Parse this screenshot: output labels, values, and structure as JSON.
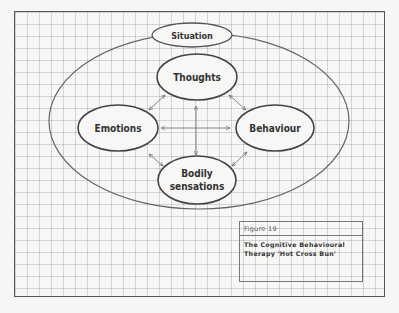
{
  "diagram": {
    "nodes": {
      "situation": "Situation",
      "thoughts": "Thoughts",
      "emotions": "Emotions",
      "behaviour": "Behaviour",
      "bodily_line1": "Bodily",
      "bodily_line2": "sensations"
    },
    "connections": [
      [
        "Thoughts",
        "Emotions"
      ],
      [
        "Thoughts",
        "Behaviour"
      ],
      [
        "Thoughts",
        "Bodily sensations"
      ],
      [
        "Emotions",
        "Behaviour"
      ],
      [
        "Emotions",
        "Bodily sensations"
      ],
      [
        "Behaviour",
        "Bodily sensations"
      ]
    ],
    "line_color": "#555555"
  },
  "caption": {
    "figure_label": "Figure  19",
    "title": "The Cognitive Behavioural Therapy  'Hot Cross Bun'"
  }
}
